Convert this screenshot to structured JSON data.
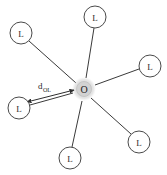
{
  "figure": {
    "name": "metal-ligand-coordination-diagram",
    "background_color": "#ffffff",
    "width": 167,
    "height": 175,
    "stroke_color": "#3a3a3a",
    "node_fill": "#ffffff",
    "node_stroke": "#4a4a4a",
    "center_halo_color": "#bdbdbd",
    "center_core_color": "#d8d8d8"
  },
  "center": {
    "label": "O",
    "cx": 84,
    "cy": 89,
    "core_radius": 7.5,
    "halo_radius": 12
  },
  "ligands": [
    {
      "label": "L",
      "cx": 21,
      "cy": 33,
      "r": 11,
      "name": "ligand-top-left"
    },
    {
      "label": "L",
      "cx": 95,
      "cy": 17,
      "r": 11,
      "name": "ligand-top"
    },
    {
      "label": "L",
      "cx": 150,
      "cy": 66,
      "r": 11,
      "name": "ligand-right"
    },
    {
      "label": "L",
      "cx": 139,
      "cy": 142,
      "r": 11,
      "name": "ligand-bottom-right"
    },
    {
      "label": "L",
      "cx": 70,
      "cy": 158,
      "r": 11,
      "name": "ligand-bottom"
    },
    {
      "label": "L",
      "cx": 19,
      "cy": 108,
      "r": 11,
      "name": "ligand-left"
    }
  ],
  "bonds": [
    {
      "name": "bond-to-top-left",
      "x1": 29,
      "y1": 41,
      "x2": 76,
      "y2": 83
    },
    {
      "name": "bond-to-top",
      "x1": 94,
      "y1": 28,
      "x2": 86,
      "y2": 78
    },
    {
      "name": "bond-to-right",
      "x1": 139,
      "y1": 69,
      "x2": 95,
      "y2": 85
    },
    {
      "name": "bond-to-bottom-right",
      "x1": 131,
      "y1": 134,
      "x2": 91,
      "y2": 98
    },
    {
      "name": "bond-to-bottom",
      "x1": 72,
      "y1": 147,
      "x2": 82,
      "y2": 101
    },
    {
      "name": "bond-to-left",
      "x1": 30,
      "y1": 105,
      "x2": 73,
      "y2": 93
    }
  ],
  "distance_arrow": {
    "name": "distance-measure-arrow",
    "x1": 27,
    "y1": 102,
    "x2": 74,
    "y2": 90,
    "label_main": "d",
    "label_sub": "OL",
    "label_x": 38,
    "label_y": 89
  }
}
